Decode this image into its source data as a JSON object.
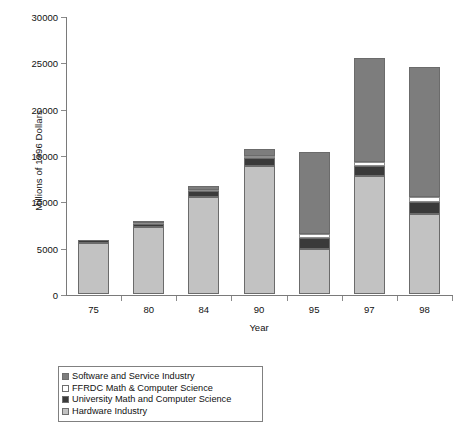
{
  "chart_data": {
    "type": "bar",
    "stacked": true,
    "title": "",
    "xlabel": "Year",
    "ylabel": "Millions of 1996 Dollars",
    "categories": [
      "75",
      "80",
      "84",
      "90",
      "95",
      "97",
      "98"
    ],
    "ylim": [
      0,
      30000
    ],
    "yticks": [
      0,
      5000,
      10000,
      15000,
      20000,
      25000,
      30000
    ],
    "ytick_labels": [
      "0",
      "5000",
      "10000",
      "15000",
      "20000",
      "25000",
      "30000"
    ],
    "grid": false,
    "legend_position": "below-left",
    "series": [
      {
        "name": "Hardware Industry",
        "color": "#c2c2c2",
        "values": [
          5500,
          7200,
          10500,
          13800,
          4900,
          12700,
          8600
        ]
      },
      {
        "name": "University Math and Computer Science",
        "color": "#3a3a3a",
        "values": [
          300,
          400,
          600,
          900,
          1100,
          1100,
          1300
        ]
      },
      {
        "name": "FFRDC Math & Computer Science",
        "color": "#ffffff",
        "values": [
          0,
          100,
          150,
          200,
          500,
          500,
          600
        ]
      },
      {
        "name": "Software and Service Industry",
        "color": "#7d7d7d",
        "values": [
          0,
          200,
          400,
          800,
          8800,
          11200,
          14000
        ]
      }
    ],
    "totals": [
      5800,
      7900,
      11650,
      15700,
      15300,
      25500,
      24500
    ],
    "legend_order_top_to_bottom": [
      "Software and Service Industry",
      "FFRDC Math & Computer Science",
      "University Math and Computer Science",
      "Hardware Industry"
    ]
  },
  "legend": {
    "items": [
      {
        "label": "Software and Service Industry",
        "color": "#7d7d7d"
      },
      {
        "label": "FFRDC Math & Computer Science",
        "color": "#ffffff"
      },
      {
        "label": "University Math and Computer Science",
        "color": "#3a3a3a"
      },
      {
        "label": "Hardware Industry",
        "color": "#c2c2c2"
      }
    ]
  }
}
